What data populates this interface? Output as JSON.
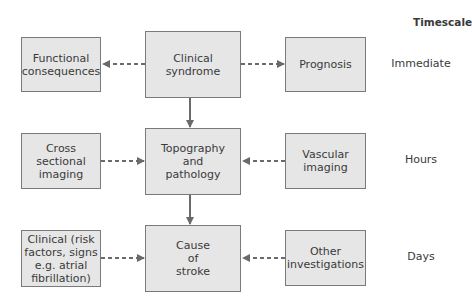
{
  "diagram": {
    "timescale_heading": "Timescale",
    "rows": [
      {
        "timescale": "Immediate",
        "left": "Functional consequences",
        "center": "Clinical syndrome",
        "right": "Prognosis",
        "left_arrow": "center-to-left",
        "right_arrow": "center-to-right"
      },
      {
        "timescale": "Hours",
        "left": "Cross sectional imaging",
        "center": "Topography and pathology",
        "right": "Vascular imaging",
        "left_arrow": "left-to-center",
        "right_arrow": "right-to-center"
      },
      {
        "timescale": "Days",
        "left": "Clinical (risk factors, signs e.g. atrial fibrillation)",
        "center": "Cause of stroke",
        "right": "Other investigations",
        "left_arrow": "left-to-center",
        "right_arrow": "right-to-center"
      }
    ],
    "vertical_flow": [
      "Clinical syndrome",
      "Topography and pathology",
      "Cause of stroke"
    ],
    "colors": {
      "box_fill": "#e6e6e6",
      "box_border": "#7a7a7a",
      "arrow": "#6a6a6a",
      "text": "#3a3a3a"
    }
  }
}
